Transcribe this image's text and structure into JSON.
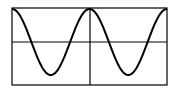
{
  "chart_data": {
    "type": "line",
    "title": "",
    "xlabel": "",
    "ylabel": "",
    "function": "y = cos(x)",
    "xlim": [
      -6.2832,
      6.2832
    ],
    "ylim": [
      -1.15,
      1.15
    ],
    "grid": false,
    "legend": null,
    "axes": {
      "x_axis_at_y": 0,
      "y_axis_at_x": 0
    },
    "series": [
      {
        "name": "cos(x)",
        "color": "#000000",
        "x": [
          -6.2832,
          -4.7124,
          -3.1416,
          -1.5708,
          0,
          1.5708,
          3.1416,
          4.7124,
          6.2832
        ],
        "values": [
          1,
          0,
          -1,
          0,
          1,
          0,
          -1,
          0,
          1
        ]
      }
    ]
  },
  "colors": {
    "frame": "#000000",
    "axes": "#000000",
    "curve": "#000000",
    "background": "#ffffff"
  }
}
